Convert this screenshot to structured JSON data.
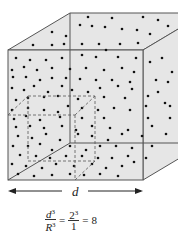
{
  "figure": {
    "dimension_label": "d",
    "formula": {
      "lhs_num": "d",
      "lhs_num_exp": "3",
      "lhs_den": "R",
      "lhs_den_exp": "3",
      "eq1": "=",
      "rhs_num": "2",
      "rhs_num_exp": "3",
      "rhs_den": "1",
      "eq2": "=",
      "result": "8"
    },
    "colors": {
      "face_fill": "#e6e6e6",
      "edge": "#555555",
      "dot": "#111111",
      "dashed": "#555555"
    },
    "big_cube": {
      "front": [
        8,
        50,
        143,
        180
      ],
      "offset": [
        62,
        -37
      ]
    },
    "small_cube": {
      "front": [
        8,
        115,
        75,
        180
      ],
      "offset": [
        20,
        -19
      ]
    },
    "dots": [
      [
        88,
        17
      ],
      [
        112,
        18
      ],
      [
        143,
        17
      ],
      [
        158,
        20
      ],
      [
        168,
        26
      ],
      [
        52,
        32
      ],
      [
        80,
        25
      ],
      [
        92,
        26
      ],
      [
        105,
        27
      ],
      [
        122,
        29
      ],
      [
        137,
        30
      ],
      [
        150,
        34
      ],
      [
        66,
        36
      ],
      [
        33,
        45
      ],
      [
        52,
        45
      ],
      [
        64,
        44
      ],
      [
        82,
        44
      ],
      [
        99,
        44
      ],
      [
        120,
        44
      ],
      [
        138,
        43
      ],
      [
        106,
        50
      ],
      [
        16,
        58
      ],
      [
        30,
        60
      ],
      [
        46,
        60
      ],
      [
        62,
        58
      ],
      [
        82,
        55
      ],
      [
        96,
        57
      ],
      [
        118,
        57
      ],
      [
        136,
        58
      ],
      [
        12,
        70
      ],
      [
        24,
        67
      ],
      [
        37,
        70
      ],
      [
        52,
        68
      ],
      [
        70,
        69
      ],
      [
        86,
        68
      ],
      [
        104,
        70
      ],
      [
        122,
        68
      ],
      [
        134,
        72
      ],
      [
        150,
        62
      ],
      [
        162,
        58
      ],
      [
        172,
        72
      ],
      [
        13,
        77
      ],
      [
        26,
        77
      ],
      [
        40,
        80
      ],
      [
        52,
        78
      ],
      [
        66,
        78
      ],
      [
        80,
        79
      ],
      [
        96,
        80
      ],
      [
        112,
        80
      ],
      [
        130,
        82
      ],
      [
        156,
        80
      ],
      [
        168,
        82
      ],
      [
        12,
        88
      ],
      [
        24,
        90
      ],
      [
        34,
        86
      ],
      [
        48,
        92
      ],
      [
        62,
        86
      ],
      [
        72,
        90
      ],
      [
        88,
        92
      ],
      [
        100,
        88
      ],
      [
        118,
        86
      ],
      [
        132,
        89
      ],
      [
        158,
        92
      ],
      [
        16,
        100
      ],
      [
        28,
        98
      ],
      [
        44,
        97
      ],
      [
        58,
        96
      ],
      [
        78,
        99
      ],
      [
        104,
        97
      ],
      [
        125,
        98
      ],
      [
        148,
        96
      ],
      [
        165,
        103
      ],
      [
        12,
        110
      ],
      [
        28,
        108
      ],
      [
        44,
        110
      ],
      [
        58,
        112
      ],
      [
        68,
        106
      ],
      [
        82,
        108
      ],
      [
        98,
        110
      ],
      [
        114,
        108
      ],
      [
        130,
        110
      ],
      [
        146,
        106
      ],
      [
        170,
        106
      ],
      [
        14,
        119
      ],
      [
        26,
        116
      ],
      [
        40,
        120
      ],
      [
        60,
        117
      ],
      [
        82,
        118
      ],
      [
        104,
        118
      ],
      [
        148,
        118
      ],
      [
        170,
        118
      ],
      [
        16,
        127
      ],
      [
        30,
        126
      ],
      [
        44,
        128
      ],
      [
        62,
        126
      ],
      [
        76,
        130
      ],
      [
        92,
        126
      ],
      [
        110,
        128
      ],
      [
        128,
        130
      ],
      [
        152,
        126
      ],
      [
        18,
        136
      ],
      [
        32,
        138
      ],
      [
        46,
        134
      ],
      [
        60,
        140
      ],
      [
        78,
        134
      ],
      [
        92,
        136
      ],
      [
        108,
        140
      ],
      [
        122,
        134
      ],
      [
        142,
        136
      ],
      [
        166,
        134
      ],
      [
        13,
        146
      ],
      [
        28,
        146
      ],
      [
        40,
        144
      ],
      [
        52,
        150
      ],
      [
        70,
        146
      ],
      [
        86,
        150
      ],
      [
        100,
        146
      ],
      [
        116,
        146
      ],
      [
        132,
        148
      ],
      [
        152,
        146
      ],
      [
        20,
        155
      ],
      [
        36,
        156
      ],
      [
        50,
        158
      ],
      [
        66,
        156
      ],
      [
        82,
        156
      ],
      [
        98,
        158
      ],
      [
        112,
        158
      ],
      [
        128,
        156
      ],
      [
        146,
        158
      ],
      [
        12,
        164
      ],
      [
        26,
        166
      ],
      [
        42,
        168
      ],
      [
        56,
        164
      ],
      [
        74,
        166
      ],
      [
        92,
        164
      ],
      [
        106,
        168
      ],
      [
        122,
        166
      ],
      [
        134,
        162
      ],
      [
        18,
        174
      ],
      [
        34,
        176
      ],
      [
        52,
        175
      ],
      [
        70,
        174
      ],
      [
        84,
        175
      ],
      [
        100,
        174
      ],
      [
        118,
        176
      ]
    ]
  }
}
